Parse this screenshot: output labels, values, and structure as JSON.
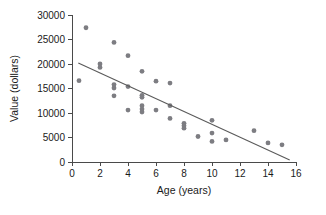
{
  "chart_data": {
    "type": "scatter",
    "title": "",
    "xlabel": "Age (years)",
    "ylabel": "Value (dollars)",
    "xlim": [
      0,
      16
    ],
    "ylim": [
      0,
      30000
    ],
    "xticks": [
      0,
      2,
      4,
      6,
      8,
      10,
      12,
      14,
      16
    ],
    "yticks": [
      0,
      5000,
      10000,
      15000,
      20000,
      25000,
      30000
    ],
    "xtick_labels": [
      "0",
      "2",
      "4",
      "6",
      "8",
      "10",
      "12",
      "14",
      "16"
    ],
    "ytick_labels": [
      "0",
      "5000",
      "10000",
      "15000",
      "20000",
      "25000",
      "30000"
    ],
    "grid": false,
    "legend": "none",
    "point_color": "#7d7d82",
    "line_color": "#5a5a5a",
    "axis_color": "#4a4a4a",
    "series": [
      {
        "name": "Vehicles",
        "marker": "circle",
        "points": [
          {
            "x": 0.5,
            "y": 16600
          },
          {
            "x": 1.0,
            "y": 27400
          },
          {
            "x": 2.0,
            "y": 20000
          },
          {
            "x": 2.0,
            "y": 19300
          },
          {
            "x": 3.0,
            "y": 24400
          },
          {
            "x": 3.0,
            "y": 15800
          },
          {
            "x": 3.0,
            "y": 15100
          },
          {
            "x": 3.0,
            "y": 13500
          },
          {
            "x": 4.0,
            "y": 21700
          },
          {
            "x": 4.0,
            "y": 15400
          },
          {
            "x": 4.0,
            "y": 10600
          },
          {
            "x": 5.0,
            "y": 18500
          },
          {
            "x": 5.0,
            "y": 13600
          },
          {
            "x": 5.0,
            "y": 13200
          },
          {
            "x": 5.0,
            "y": 11500
          },
          {
            "x": 5.0,
            "y": 10800
          },
          {
            "x": 5.0,
            "y": 10200
          },
          {
            "x": 6.0,
            "y": 16500
          },
          {
            "x": 6.0,
            "y": 10600
          },
          {
            "x": 7.0,
            "y": 16100
          },
          {
            "x": 7.0,
            "y": 11500
          },
          {
            "x": 7.0,
            "y": 8900
          },
          {
            "x": 8.0,
            "y": 7900
          },
          {
            "x": 8.0,
            "y": 7400
          },
          {
            "x": 8.0,
            "y": 6900
          },
          {
            "x": 9.0,
            "y": 5200
          },
          {
            "x": 10.0,
            "y": 8500
          },
          {
            "x": 10.0,
            "y": 5900
          },
          {
            "x": 10.0,
            "y": 4200
          },
          {
            "x": 11.0,
            "y": 4500
          },
          {
            "x": 13.0,
            "y": 6400
          },
          {
            "x": 14.0,
            "y": 3900
          },
          {
            "x": 15.0,
            "y": 3500
          }
        ]
      }
    ],
    "trend_line": {
      "name": "least-squares fit",
      "x_start": 0.45,
      "y_start": 20200,
      "x_end": 15.55,
      "y_end": 400
    }
  }
}
